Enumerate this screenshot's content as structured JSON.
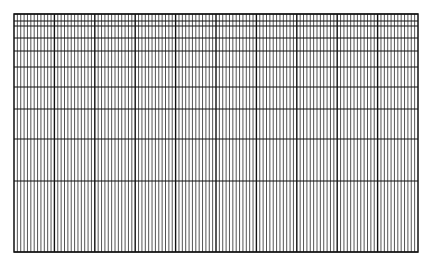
{
  "grid": {
    "left": 14,
    "top": 14,
    "right": 418,
    "bottom": 252,
    "major_columns": 10,
    "minor_per_major": 12,
    "horizontal_lines": [
      14,
      21,
      26,
      38,
      51,
      67,
      87,
      109,
      139,
      181,
      252
    ],
    "colors": {
      "minor_line": "#555555",
      "major_line": "#111111",
      "border": "#111111",
      "background": "#ffffff"
    }
  }
}
